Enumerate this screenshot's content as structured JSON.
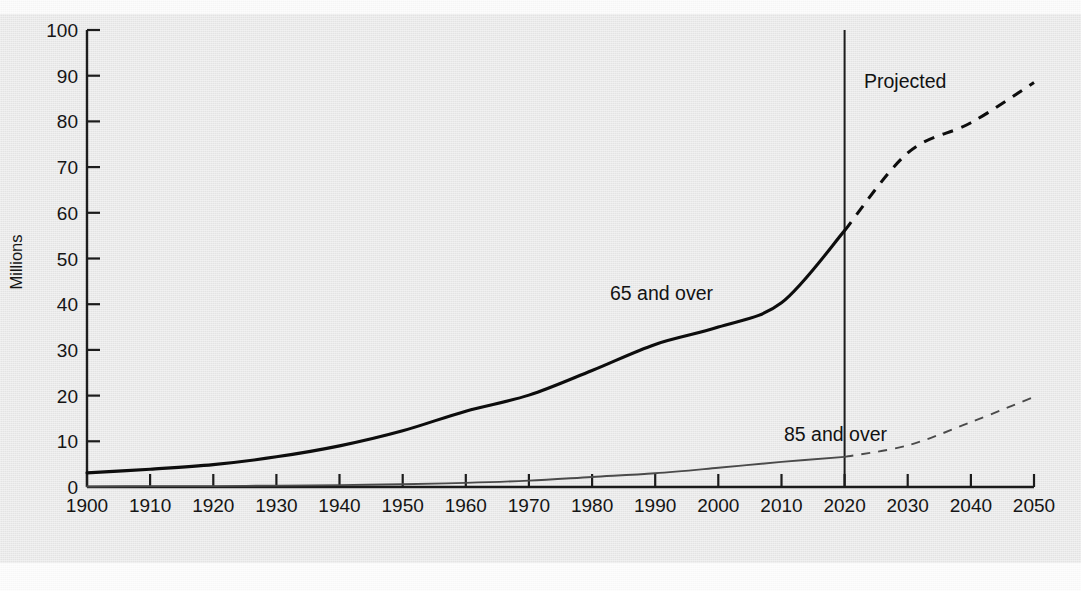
{
  "chart_data": {
    "type": "line",
    "title": "",
    "xlabel": "",
    "ylabel": "Millions",
    "xlim": [
      1900,
      2050
    ],
    "ylim": [
      0,
      100
    ],
    "grid": false,
    "legend_position": "inline-annotations",
    "x": [
      1900,
      1910,
      1920,
      1930,
      1940,
      1950,
      1960,
      1970,
      1980,
      1990,
      2000,
      2010,
      2020,
      2030,
      2040,
      2050
    ],
    "x_tick_labels": [
      "1900",
      "1910",
      "1920",
      "1930",
      "1940",
      "1950",
      "1960",
      "1970",
      "1980",
      "1990",
      "2000",
      "2010",
      "2020",
      "2030",
      "2040",
      "2050"
    ],
    "y_tick_labels": [
      "0",
      "10",
      "20",
      "30",
      "40",
      "50",
      "60",
      "70",
      "80",
      "90",
      "100"
    ],
    "y_ticks": [
      0,
      10,
      20,
      30,
      40,
      50,
      60,
      70,
      80,
      90,
      100
    ],
    "series": [
      {
        "name": "65 and over",
        "label": "65 and over",
        "color": "#0d0d0d",
        "line_width": 3.1,
        "actual_range": [
          1900,
          2020
        ],
        "projected_range": [
          2020,
          2050
        ],
        "values": [
          3.1,
          3.9,
          4.9,
          6.6,
          9.0,
          12.3,
          16.6,
          20.1,
          25.5,
          31.2,
          35.0,
          40.3,
          56.1,
          73.1,
          79.7,
          88.5
        ]
      },
      {
        "name": "85 and over",
        "label": "85 and over",
        "color": "#4a4a4a",
        "line_width": 1.9,
        "actual_range": [
          1900,
          2020
        ],
        "projected_range": [
          2020,
          2050
        ],
        "values": [
          0.1,
          0.2,
          0.2,
          0.3,
          0.4,
          0.6,
          0.9,
          1.4,
          2.2,
          3.0,
          4.2,
          5.5,
          6.6,
          9.1,
          14.2,
          19.7
        ]
      }
    ],
    "annotations": [
      {
        "text": "65 and over",
        "x": 1985,
        "y": 42,
        "name": "series-label-65-and-over"
      },
      {
        "text": "85 and over",
        "x": 2008,
        "y": 13.5,
        "name": "series-label-85-and-over"
      },
      {
        "text": "Projected",
        "x": 2024,
        "y": 89,
        "name": "projected-label"
      }
    ],
    "divider": {
      "label": "Projected",
      "x_value": 2020,
      "style": "solid-vertical",
      "color": "#1a1a1a"
    },
    "projection_line_style": "dashed"
  }
}
